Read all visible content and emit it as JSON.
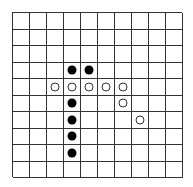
{
  "board": {
    "columns": 10,
    "rows": 10,
    "line_color": "#333333",
    "background": "#ffffff",
    "stones": [
      {
        "color": "black",
        "col": 3,
        "row": 3
      },
      {
        "color": "black",
        "col": 4,
        "row": 3
      },
      {
        "color": "white",
        "col": 2,
        "row": 4
      },
      {
        "color": "white",
        "col": 3,
        "row": 4
      },
      {
        "color": "white",
        "col": 4,
        "row": 4
      },
      {
        "color": "white",
        "col": 5,
        "row": 4
      },
      {
        "color": "white",
        "col": 6,
        "row": 4
      },
      {
        "color": "black",
        "col": 3,
        "row": 5
      },
      {
        "color": "white",
        "col": 6,
        "row": 5
      },
      {
        "color": "black",
        "col": 3,
        "row": 6
      },
      {
        "color": "white",
        "col": 7,
        "row": 6
      },
      {
        "color": "black",
        "col": 3,
        "row": 7
      },
      {
        "color": "black",
        "col": 3,
        "row": 8
      }
    ]
  }
}
